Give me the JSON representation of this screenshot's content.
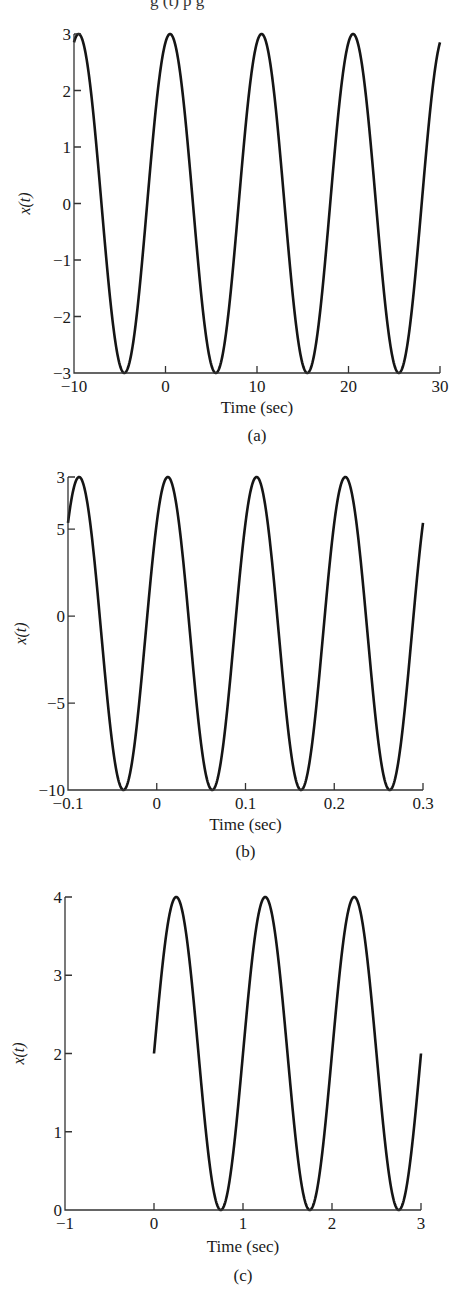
{
  "page": {
    "top_text_fragment": "g    (t) p          g"
  },
  "chart_data": [
    {
      "id": "a",
      "type": "line",
      "caption": "(a)",
      "title": "",
      "xlabel": "Time (sec)",
      "ylabel": "x(t)",
      "xlim": [
        -10,
        30
      ],
      "ylim": [
        -3,
        3
      ],
      "xticks": [
        "−10",
        "0",
        "10",
        "20",
        "30"
      ],
      "yticks": [
        "3",
        "2",
        "1",
        "0",
        "−1",
        "−2",
        "−3"
      ],
      "xtick_values": [
        -10,
        0,
        10,
        20,
        30
      ],
      "ytick_values": [
        3,
        2,
        1,
        0,
        -1,
        -2,
        -3
      ],
      "grid": false,
      "series": [
        {
          "name": "x(t)",
          "formula": "3*cos(2*pi*0.1*(t-0.5))",
          "amplitude": 3,
          "offset": 0,
          "frequency_hz": 0.1,
          "peak_times": [
            -9.5,
            0.5,
            10.5,
            20.5
          ],
          "trough_times": [
            -4.5,
            5.5,
            15.5,
            25.5
          ],
          "t_range": [
            -10,
            30
          ]
        }
      ]
    },
    {
      "id": "b",
      "type": "line",
      "caption": "(b)",
      "title": "",
      "xlabel": "Time (sec)",
      "ylabel": "x(t)",
      "xlim": [
        -0.1,
        0.3
      ],
      "ylim": [
        -10,
        8
      ],
      "xticks": [
        "−0.1",
        "0",
        "0.1",
        "0.2",
        "0.3"
      ],
      "yticks": [
        "3",
        "5",
        "0",
        "−5",
        "−10"
      ],
      "xtick_values": [
        -0.1,
        0,
        0.1,
        0.2,
        0.3
      ],
      "ytick_values": [
        8,
        5,
        0,
        -5,
        -10
      ],
      "grid": false,
      "series": [
        {
          "name": "x(t)",
          "formula": "9*cos(2*pi*10*(t-0.0125)) - 1",
          "amplitude": 9,
          "offset": -1,
          "frequency_hz": 10,
          "peak_times": [
            -0.0875,
            0.0125,
            0.1125,
            0.2125
          ],
          "trough_times": [
            -0.0375,
            0.0625,
            0.1625,
            0.2625
          ],
          "t_range": [
            -0.1,
            0.3
          ]
        }
      ]
    },
    {
      "id": "c",
      "type": "line",
      "caption": "(c)",
      "title": "",
      "xlabel": "Time (sec)",
      "ylabel": "x(t)",
      "xlim": [
        -1,
        3
      ],
      "ylim": [
        0,
        4
      ],
      "xticks": [
        "−1",
        "0",
        "1",
        "2",
        "3"
      ],
      "yticks": [
        "4",
        "3",
        "2",
        "1",
        "0"
      ],
      "xtick_values": [
        -1,
        0,
        1,
        2,
        3
      ],
      "ytick_values": [
        4,
        3,
        2,
        1,
        0
      ],
      "grid": false,
      "series": [
        {
          "name": "x(t)",
          "formula": "2 + 2*sin(2*pi*1*t)",
          "amplitude": 2,
          "offset": 2,
          "frequency_hz": 1,
          "peak_times": [
            0.25,
            1.25,
            2.25
          ],
          "trough_times": [
            0.75,
            1.75,
            2.75
          ],
          "t_range": [
            0,
            3
          ]
        }
      ]
    }
  ]
}
